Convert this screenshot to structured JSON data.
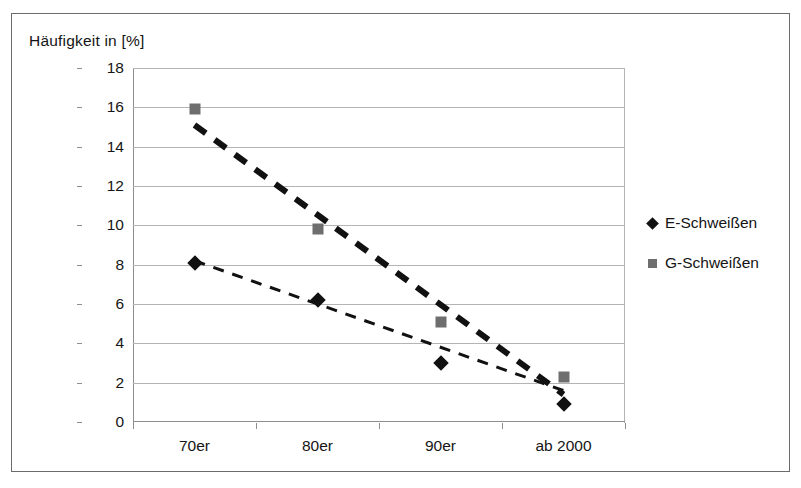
{
  "chart_data": {
    "type": "scatter",
    "title": "Häufigkeit in [%]",
    "xlabel": "",
    "ylabel": "Häufigkeit in [%]",
    "categories": [
      "70er",
      "80er",
      "90er",
      "ab 2000"
    ],
    "ylim": [
      0,
      18
    ],
    "ytick_step": 2,
    "yticks": [
      "0",
      "2",
      "4",
      "6",
      "8",
      "10",
      "12",
      "14",
      "16",
      "18"
    ],
    "grid": true,
    "legend_position": "right",
    "series": [
      {
        "name": "E-Schweißen",
        "marker": "diamond",
        "color": "#111111",
        "values": [
          8.1,
          6.2,
          3.0,
          0.9
        ],
        "trendline": {
          "style": "dashed-thin",
          "start": 8.2,
          "end": 1.6
        }
      },
      {
        "name": "G-Schweißen",
        "marker": "square",
        "color": "#6e6e6e",
        "values": [
          15.9,
          9.8,
          5.1,
          2.3
        ],
        "trendline": {
          "style": "dashed-thick",
          "start": 15.1,
          "end": 1.4
        }
      }
    ]
  }
}
